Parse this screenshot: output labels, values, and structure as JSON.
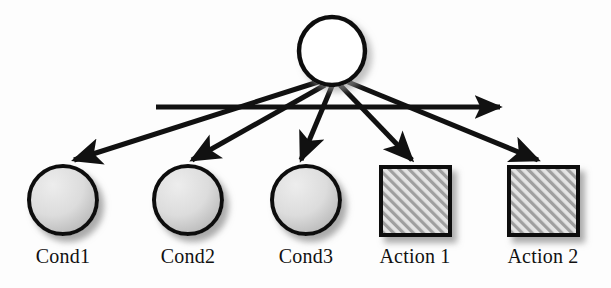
{
  "figure": {
    "background_color": "#fdfdfd",
    "stroke_color": "#111111",
    "shadow_color": "#9a9a9a"
  },
  "root_node": {
    "name": "root-node",
    "shape": "circle",
    "fill": "#ffffff",
    "stroke": "#111111",
    "cx": 332,
    "cy": 51,
    "rx": 33,
    "ry": 34,
    "label": ""
  },
  "horizontal_arrow": {
    "name": "horizontal-sequence-arrow",
    "x1": 156,
    "x2": 502,
    "y": 107,
    "stroke": "#111111",
    "label": ""
  },
  "child_nodes": [
    {
      "id": "cond1",
      "label": "Cond1",
      "type": "condition",
      "shape": "ellipse",
      "cx": 63,
      "cy": 200,
      "rx": 34,
      "ry": 34,
      "fill_light": "#e9e9e9",
      "fill_dark": "#b8b8b8",
      "label_x": 63,
      "label_y": 263
    },
    {
      "id": "cond2",
      "label": "Cond2",
      "type": "condition",
      "shape": "ellipse",
      "cx": 188,
      "cy": 200,
      "rx": 34,
      "ry": 34,
      "fill_light": "#e9e9e9",
      "fill_dark": "#b8b8b8",
      "label_x": 188,
      "label_y": 263
    },
    {
      "id": "cond3",
      "label": "Cond3",
      "type": "condition",
      "shape": "ellipse",
      "cx": 306,
      "cy": 200,
      "rx": 34,
      "ry": 34,
      "fill_light": "#e9e9e9",
      "fill_dark": "#b8b8b8",
      "label_x": 306,
      "label_y": 263
    },
    {
      "id": "action1",
      "label": "Action 1",
      "type": "action",
      "shape": "square",
      "x": 381,
      "y": 167,
      "width": 69,
      "height": 68,
      "fill": "#d9d9d9",
      "hatch": "diagonal-up",
      "label_x": 415,
      "label_y": 263
    },
    {
      "id": "action2",
      "label": "Action 2",
      "type": "action",
      "shape": "square",
      "x": 509,
      "y": 167,
      "width": 69,
      "height": 68,
      "fill": "#d9d9d9",
      "hatch": "diagonal-up",
      "label_x": 543,
      "label_y": 263
    }
  ],
  "edges": [
    {
      "id": "edge-root-cond1",
      "from": "root-node",
      "to": "cond1",
      "x1": 318,
      "y1": 82,
      "x2": 74,
      "y2": 160
    },
    {
      "id": "edge-root-cond2",
      "from": "root-node",
      "to": "cond2",
      "x1": 325,
      "y1": 85,
      "x2": 192,
      "y2": 160
    },
    {
      "id": "edge-root-cond3",
      "from": "root-node",
      "to": "cond3",
      "x1": 332,
      "y1": 86,
      "x2": 301,
      "y2": 160
    },
    {
      "id": "edge-root-action1",
      "from": "root-node",
      "to": "action1",
      "x1": 340,
      "y1": 85,
      "x2": 412,
      "y2": 160
    },
    {
      "id": "edge-root-action2",
      "from": "root-node",
      "to": "action2",
      "x1": 348,
      "y1": 82,
      "x2": 538,
      "y2": 160
    }
  ]
}
